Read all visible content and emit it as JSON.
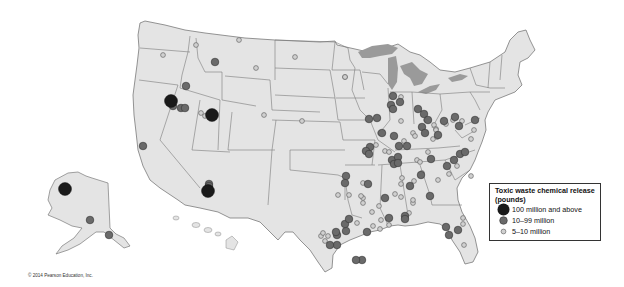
{
  "map": {
    "subject": "Toxic waste chemical release in the United States",
    "land_color": "#e4e4e4",
    "border_color": "#6e6e6e",
    "water_color": "#9a9a9a",
    "background_color": "#ffffff"
  },
  "legend": {
    "title": "Toxic waste chemical release (pounds)",
    "title_line1": "Toxic waste chemical release",
    "title_line2": "(pounds)",
    "items": [
      {
        "label": "100 million and above",
        "size": "large",
        "color": "#1a1a1a"
      },
      {
        "label": "10–99 million",
        "size": "medium",
        "color": "#6a6a6a"
      },
      {
        "label": "5–10 million",
        "size": "small",
        "color": "#b8b8b8"
      }
    ]
  },
  "markers": {
    "large": [
      {
        "x": 171,
        "y": 101,
        "region": "Nevada"
      },
      {
        "x": 212,
        "y": 115,
        "region": "Utah"
      },
      {
        "x": 208,
        "y": 191,
        "region": "Arizona"
      },
      {
        "x": 65,
        "y": 189,
        "region": "Alaska"
      }
    ],
    "medium": [
      {
        "x": 173,
        "y": 106
      },
      {
        "x": 181,
        "y": 108
      },
      {
        "x": 185,
        "y": 108
      },
      {
        "x": 215,
        "y": 62
      },
      {
        "x": 186,
        "y": 86
      },
      {
        "x": 143,
        "y": 146
      },
      {
        "x": 209,
        "y": 184
      },
      {
        "x": 209,
        "y": 186
      },
      {
        "x": 90,
        "y": 220
      },
      {
        "x": 109,
        "y": 235
      },
      {
        "x": 369,
        "y": 119
      },
      {
        "x": 377,
        "y": 118
      },
      {
        "x": 393,
        "y": 96
      },
      {
        "x": 391,
        "y": 105
      },
      {
        "x": 400,
        "y": 102
      },
      {
        "x": 393,
        "y": 109
      },
      {
        "x": 418,
        "y": 109
      },
      {
        "x": 424,
        "y": 114
      },
      {
        "x": 428,
        "y": 120
      },
      {
        "x": 444,
        "y": 121
      },
      {
        "x": 455,
        "y": 117
      },
      {
        "x": 422,
        "y": 127
      },
      {
        "x": 425,
        "y": 133
      },
      {
        "x": 438,
        "y": 135
      },
      {
        "x": 459,
        "y": 126
      },
      {
        "x": 475,
        "y": 120
      },
      {
        "x": 382,
        "y": 133
      },
      {
        "x": 394,
        "y": 136
      },
      {
        "x": 399,
        "y": 146
      },
      {
        "x": 407,
        "y": 146
      },
      {
        "x": 370,
        "y": 147
      },
      {
        "x": 366,
        "y": 151
      },
      {
        "x": 369,
        "y": 154
      },
      {
        "x": 392,
        "y": 160
      },
      {
        "x": 398,
        "y": 157
      },
      {
        "x": 394,
        "y": 164
      },
      {
        "x": 398,
        "y": 163
      },
      {
        "x": 431,
        "y": 159
      },
      {
        "x": 454,
        "y": 160
      },
      {
        "x": 460,
        "y": 154
      },
      {
        "x": 465,
        "y": 152
      },
      {
        "x": 447,
        "y": 166
      },
      {
        "x": 421,
        "y": 175
      },
      {
        "x": 410,
        "y": 186
      },
      {
        "x": 430,
        "y": 196
      },
      {
        "x": 346,
        "y": 176
      },
      {
        "x": 345,
        "y": 183
      },
      {
        "x": 368,
        "y": 184
      },
      {
        "x": 389,
        "y": 218
      },
      {
        "x": 405,
        "y": 216
      },
      {
        "x": 405,
        "y": 219
      },
      {
        "x": 346,
        "y": 231
      },
      {
        "x": 337,
        "y": 235
      },
      {
        "x": 336,
        "y": 232
      },
      {
        "x": 345,
        "y": 224
      },
      {
        "x": 349,
        "y": 219
      },
      {
        "x": 446,
        "y": 227
      },
      {
        "x": 458,
        "y": 230
      },
      {
        "x": 449,
        "y": 235
      },
      {
        "x": 337,
        "y": 245
      },
      {
        "x": 330,
        "y": 245
      },
      {
        "x": 362,
        "y": 260
      },
      {
        "x": 356,
        "y": 260
      },
      {
        "x": 385,
        "y": 198
      },
      {
        "x": 367,
        "y": 232
      }
    ],
    "small": [
      {
        "x": 163,
        "y": 55
      },
      {
        "x": 196,
        "y": 45
      },
      {
        "x": 256,
        "y": 68
      },
      {
        "x": 295,
        "y": 57
      },
      {
        "x": 345,
        "y": 77
      },
      {
        "x": 264,
        "y": 115
      },
      {
        "x": 302,
        "y": 121
      },
      {
        "x": 239,
        "y": 40
      },
      {
        "x": 201,
        "y": 113
      },
      {
        "x": 205,
        "y": 116
      },
      {
        "x": 345,
        "y": 77
      },
      {
        "x": 401,
        "y": 97
      },
      {
        "x": 401,
        "y": 121
      },
      {
        "x": 380,
        "y": 133
      },
      {
        "x": 413,
        "y": 133
      },
      {
        "x": 415,
        "y": 136
      },
      {
        "x": 404,
        "y": 141
      },
      {
        "x": 376,
        "y": 145
      },
      {
        "x": 385,
        "y": 151
      },
      {
        "x": 389,
        "y": 152
      },
      {
        "x": 426,
        "y": 120
      },
      {
        "x": 434,
        "y": 125
      },
      {
        "x": 436,
        "y": 129
      },
      {
        "x": 436,
        "y": 130
      },
      {
        "x": 433,
        "y": 139
      },
      {
        "x": 446,
        "y": 124
      },
      {
        "x": 437,
        "y": 137
      },
      {
        "x": 453,
        "y": 120
      },
      {
        "x": 462,
        "y": 121
      },
      {
        "x": 474,
        "y": 130
      },
      {
        "x": 471,
        "y": 139
      },
      {
        "x": 398,
        "y": 159
      },
      {
        "x": 417,
        "y": 160
      },
      {
        "x": 420,
        "y": 162
      },
      {
        "x": 428,
        "y": 152
      },
      {
        "x": 449,
        "y": 174
      },
      {
        "x": 457,
        "y": 166
      },
      {
        "x": 471,
        "y": 176
      },
      {
        "x": 402,
        "y": 178
      },
      {
        "x": 414,
        "y": 181
      },
      {
        "x": 401,
        "y": 184
      },
      {
        "x": 422,
        "y": 173
      },
      {
        "x": 438,
        "y": 180
      },
      {
        "x": 413,
        "y": 203
      },
      {
        "x": 395,
        "y": 194
      },
      {
        "x": 349,
        "y": 195
      },
      {
        "x": 363,
        "y": 198
      },
      {
        "x": 363,
        "y": 183
      },
      {
        "x": 361,
        "y": 196
      },
      {
        "x": 379,
        "y": 206
      },
      {
        "x": 372,
        "y": 212
      },
      {
        "x": 381,
        "y": 220
      },
      {
        "x": 389,
        "y": 225
      },
      {
        "x": 401,
        "y": 197
      },
      {
        "x": 409,
        "y": 213
      },
      {
        "x": 413,
        "y": 200
      },
      {
        "x": 463,
        "y": 218
      },
      {
        "x": 463,
        "y": 224
      },
      {
        "x": 464,
        "y": 245
      },
      {
        "x": 338,
        "y": 195
      },
      {
        "x": 328,
        "y": 236
      },
      {
        "x": 373,
        "y": 226
      },
      {
        "x": 380,
        "y": 229
      },
      {
        "x": 357,
        "y": 223
      },
      {
        "x": 363,
        "y": 203
      },
      {
        "x": 321,
        "y": 236
      },
      {
        "x": 325,
        "y": 241
      },
      {
        "x": 323,
        "y": 233
      }
    ]
  },
  "footer": {
    "copyright": "© 2014 Pearson Education, Inc."
  }
}
